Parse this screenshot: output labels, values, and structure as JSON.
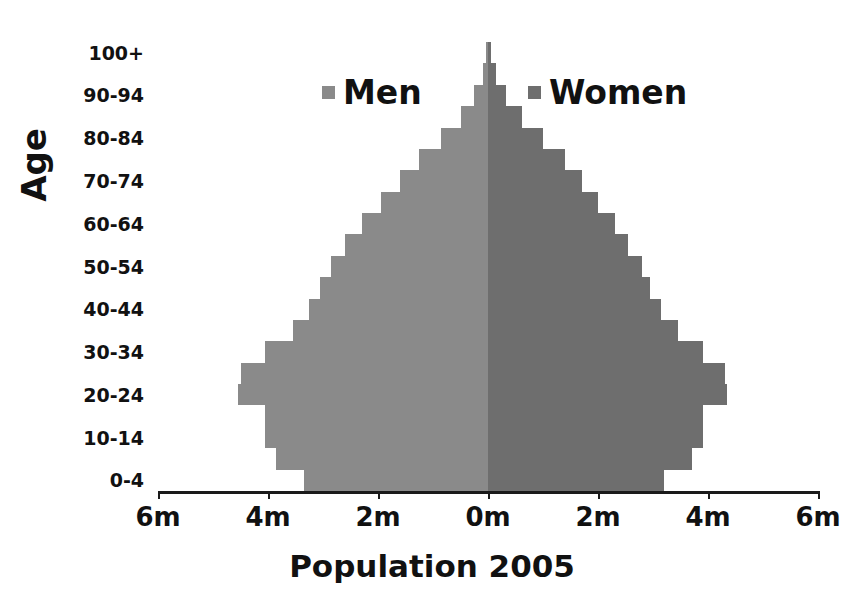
{
  "chart_data": {
    "type": "bar",
    "subtype": "population-pyramid",
    "title": "Population 2005",
    "xlabel": "Population 2005",
    "ylabel": "Age",
    "orientation": "horizontal-diverging",
    "grid": false,
    "legend_position": "top-inside",
    "xlim": [
      -6,
      6
    ],
    "x_unit": "millions",
    "x_tick_labels": [
      "6m",
      "4m",
      "2m",
      "0m",
      "2m",
      "4m",
      "6m"
    ],
    "x_tick_values": [
      -6,
      -4,
      -2,
      0,
      2,
      4,
      6
    ],
    "y_tick_labels": [
      "100+",
      "90-94",
      "80-84",
      "70-74",
      "60-64",
      "50-54",
      "40-44",
      "30-34",
      "20-24",
      "10-14",
      "0-4"
    ],
    "categories": [
      "0-4",
      "5-9",
      "10-14",
      "15-19",
      "20-24",
      "25-29",
      "30-34",
      "35-39",
      "40-44",
      "45-49",
      "50-54",
      "55-59",
      "60-64",
      "65-69",
      "70-74",
      "75-79",
      "80-84",
      "85-89",
      "90-94",
      "95-99",
      "100+"
    ],
    "series": [
      {
        "name": "Men",
        "color": "#8a8a8a",
        "values": [
          3.35,
          3.85,
          4.05,
          4.05,
          4.55,
          4.5,
          4.05,
          3.55,
          3.25,
          3.05,
          2.85,
          2.6,
          2.3,
          1.95,
          1.6,
          1.25,
          0.85,
          0.5,
          0.25,
          0.1,
          0.04
        ]
      },
      {
        "name": "Women",
        "color": "#6e6e6e",
        "values": [
          3.2,
          3.7,
          3.9,
          3.9,
          4.35,
          4.3,
          3.9,
          3.45,
          3.15,
          2.95,
          2.8,
          2.55,
          2.3,
          2.0,
          1.7,
          1.4,
          1.0,
          0.62,
          0.32,
          0.14,
          0.05
        ]
      }
    ]
  },
  "legend": {
    "men": {
      "label": "Men",
      "color": "#8a8a8a"
    },
    "women": {
      "label": "Women",
      "color": "#6e6e6e"
    }
  },
  "axis": {
    "y_title": "Age",
    "x_title": "Population 2005"
  }
}
